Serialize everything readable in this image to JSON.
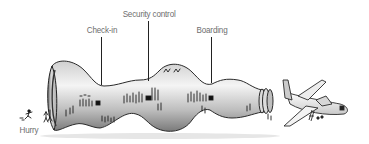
{
  "diagram": {
    "stages": [
      {
        "id": "hurry",
        "label": "Hurry"
      },
      {
        "id": "check-in",
        "label": "Check-in"
      },
      {
        "id": "security-control",
        "label": "Security control"
      },
      {
        "id": "boarding",
        "label": "Boarding"
      }
    ],
    "end_illustration": "airplane",
    "colors": {
      "label_text": "#6e6e6e",
      "leader_line": "#222222",
      "tube_outline": "#2a2a2a",
      "tube_fill_light": "#f2f2f2",
      "tube_fill_dark": "#9a9a9a"
    }
  }
}
